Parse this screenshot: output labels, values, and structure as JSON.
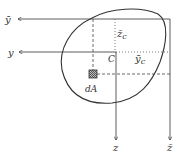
{
  "diagram": {
    "colors": {
      "line": "#333333",
      "element_fill": "#888888",
      "background": "#ffffff"
    },
    "labels": {
      "y_bar": "ȳ",
      "y": "y",
      "z": "z",
      "z_bar": "z̄",
      "z_c": "z̄",
      "z_c_sub": "c",
      "y_c": "ȳ",
      "y_c_sub": "c",
      "centroid": "C",
      "area_element": "dA"
    }
  }
}
